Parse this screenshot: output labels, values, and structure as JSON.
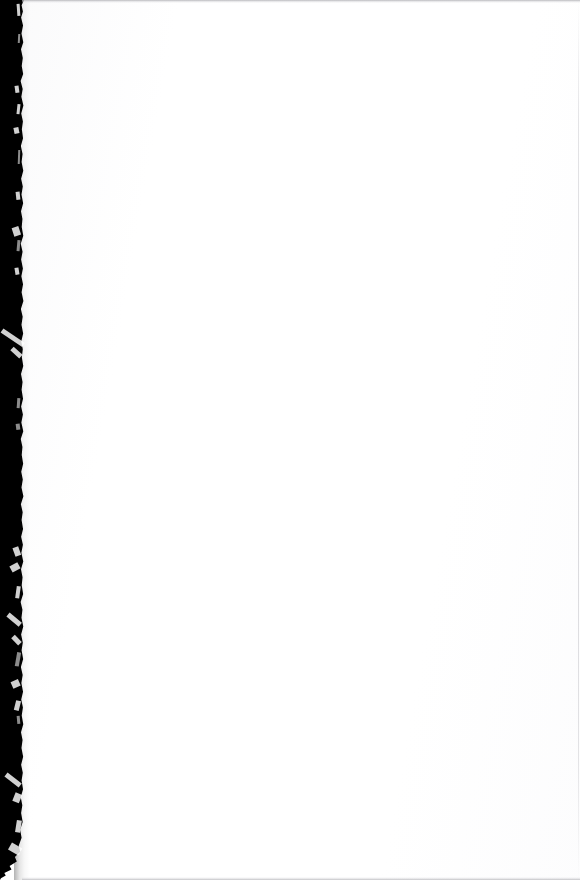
{
  "page": {
    "kind": "scanned-document-page",
    "content_state": "blank",
    "body_text": "",
    "width_px": 580,
    "height_px": 880,
    "orientation": "portrait",
    "background_color": "#ffffff"
  },
  "gutter": {
    "name": "binding-shadow",
    "side": "left",
    "color": "#000000",
    "width_px": 22,
    "edge": "irregular",
    "artifacts_label": "white-streak"
  },
  "scan_artifacts": {
    "top_line_color": "#b0b0b4",
    "bottom_line_color": "#b6b6ba",
    "right_line_color": "#c6c6cb",
    "paper_tone_color": "#fafafb"
  },
  "streaks": [
    {
      "x": 17,
      "y": 4,
      "w": 3,
      "h": 12,
      "angle": -4,
      "kind": "soft"
    },
    {
      "x": 18,
      "y": 34,
      "w": 2,
      "h": 9,
      "angle": 3,
      "kind": "dim"
    },
    {
      "x": 15,
      "y": 86,
      "w": 4,
      "h": 7,
      "angle": -8,
      "kind": "soft"
    },
    {
      "x": 17,
      "y": 104,
      "w": 3,
      "h": 10,
      "angle": 6,
      "kind": "soft"
    },
    {
      "x": 14,
      "y": 128,
      "w": 5,
      "h": 6,
      "angle": -12,
      "kind": "soft"
    },
    {
      "x": 18,
      "y": 150,
      "w": 2,
      "h": 14,
      "angle": 2,
      "kind": "dim"
    },
    {
      "x": 16,
      "y": 192,
      "w": 4,
      "h": 8,
      "angle": -6,
      "kind": "soft"
    },
    {
      "x": 13,
      "y": 228,
      "w": 7,
      "h": 9,
      "angle": -18,
      "kind": "soft"
    },
    {
      "x": 17,
      "y": 240,
      "w": 3,
      "h": 11,
      "angle": 5,
      "kind": "dim"
    },
    {
      "x": 15,
      "y": 268,
      "w": 4,
      "h": 7,
      "angle": -9,
      "kind": "soft"
    },
    {
      "x": 2,
      "y": 328,
      "w": 26,
      "h": 5,
      "angle": 34,
      "kind": "soft"
    },
    {
      "x": 12,
      "y": 346,
      "w": 12,
      "h": 5,
      "angle": 42,
      "kind": "soft"
    },
    {
      "x": 17,
      "y": 398,
      "w": 3,
      "h": 10,
      "angle": 4,
      "kind": "dim"
    },
    {
      "x": 16,
      "y": 424,
      "w": 4,
      "h": 6,
      "angle": -7,
      "kind": "dim"
    },
    {
      "x": 14,
      "y": 548,
      "w": 6,
      "h": 9,
      "angle": -20,
      "kind": "soft"
    },
    {
      "x": 11,
      "y": 566,
      "w": 9,
      "h": 7,
      "angle": -28,
      "kind": "soft"
    },
    {
      "x": 16,
      "y": 586,
      "w": 4,
      "h": 12,
      "angle": 8,
      "kind": "soft"
    },
    {
      "x": 8,
      "y": 612,
      "w": 16,
      "h": 5,
      "angle": 40,
      "kind": "soft"
    },
    {
      "x": 13,
      "y": 634,
      "w": 10,
      "h": 5,
      "angle": 46,
      "kind": "soft"
    },
    {
      "x": 16,
      "y": 652,
      "w": 4,
      "h": 14,
      "angle": 10,
      "kind": "dim"
    },
    {
      "x": 12,
      "y": 682,
      "w": 8,
      "h": 7,
      "angle": -24,
      "kind": "soft"
    },
    {
      "x": 15,
      "y": 700,
      "w": 5,
      "h": 10,
      "angle": 14,
      "kind": "soft"
    },
    {
      "x": 17,
      "y": 716,
      "w": 3,
      "h": 8,
      "angle": -5,
      "kind": "dim"
    },
    {
      "x": 6,
      "y": 772,
      "w": 18,
      "h": 5,
      "angle": 38,
      "kind": "soft"
    },
    {
      "x": 14,
      "y": 792,
      "w": 7,
      "h": 9,
      "angle": 22,
      "kind": "soft"
    },
    {
      "x": 16,
      "y": 820,
      "w": 5,
      "h": 12,
      "angle": 9,
      "kind": "soft"
    },
    {
      "x": 10,
      "y": 842,
      "w": 12,
      "h": 8,
      "angle": 30,
      "kind": "soft"
    }
  ]
}
